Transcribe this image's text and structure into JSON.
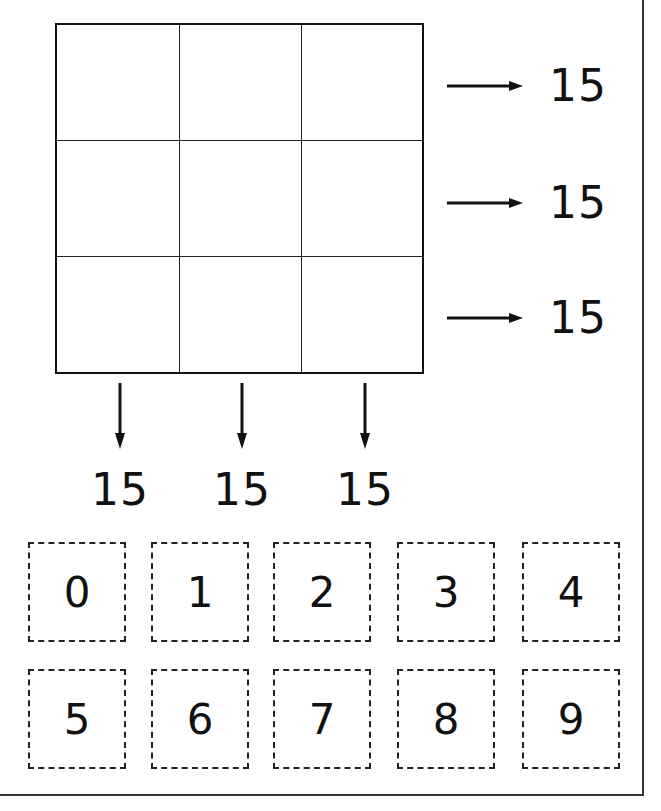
{
  "puzzle": {
    "grid": {
      "rows": 3,
      "cols": 3,
      "cells": [
        [
          "",
          "",
          ""
        ],
        [
          "",
          "",
          ""
        ],
        [
          "",
          "",
          ""
        ]
      ]
    },
    "row_sums": [
      "15",
      "15",
      "15"
    ],
    "col_sums": [
      "15",
      "15",
      "15"
    ],
    "arrow_icons": {
      "row": "arrow-right-icon",
      "col": "arrow-down-icon"
    }
  },
  "tiles": {
    "row1": [
      "0",
      "1",
      "2",
      "3",
      "4"
    ],
    "row2": [
      "5",
      "6",
      "7",
      "8",
      "9"
    ]
  }
}
